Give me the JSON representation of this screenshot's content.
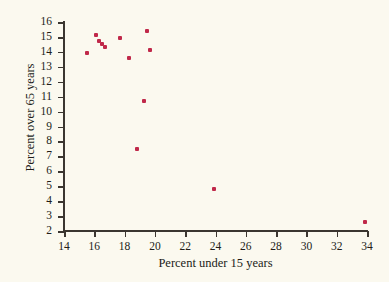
{
  "chart_data": {
    "type": "scatter",
    "title": "",
    "xlabel": "Percent under 15 years",
    "ylabel": "Percent over 65 years",
    "xlim": [
      14,
      34
    ],
    "ylim": [
      2,
      16
    ],
    "grid": false,
    "legend": null,
    "marker_color": "#c0294a",
    "background_color": "#fbf9ef",
    "axis_color": "#3b3630",
    "xticks": [
      14,
      16,
      18,
      20,
      22,
      24,
      26,
      28,
      30,
      32,
      34
    ],
    "yticks": [
      2,
      3,
      4,
      5,
      6,
      7,
      8,
      9,
      10,
      11,
      12,
      13,
      14,
      15,
      16
    ],
    "xtick_labels": [
      "14",
      "16",
      "18",
      "20",
      "22",
      "24",
      "26",
      "28",
      "30",
      "32",
      "34"
    ],
    "ytick_labels": [
      "2",
      "3",
      "4",
      "5",
      "6",
      "7",
      "8",
      "9",
      "10",
      "11",
      "12",
      "13",
      "14",
      "15",
      "16"
    ],
    "points": [
      {
        "x": 15.5,
        "y": 13.95
      },
      {
        "x": 16.1,
        "y": 15.1
      },
      {
        "x": 16.3,
        "y": 14.7
      },
      {
        "x": 16.5,
        "y": 14.55
      },
      {
        "x": 16.7,
        "y": 14.3
      },
      {
        "x": 17.7,
        "y": 14.9
      },
      {
        "x": 18.3,
        "y": 13.6
      },
      {
        "x": 19.5,
        "y": 15.4
      },
      {
        "x": 19.65,
        "y": 14.1
      },
      {
        "x": 19.3,
        "y": 10.7
      },
      {
        "x": 18.8,
        "y": 7.5
      },
      {
        "x": 23.9,
        "y": 4.8
      },
      {
        "x": 33.9,
        "y": 2.6
      }
    ]
  }
}
